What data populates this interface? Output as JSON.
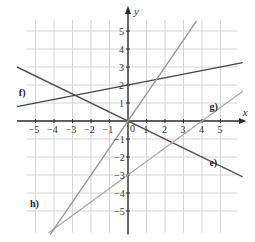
{
  "chart_data": {
    "type": "line",
    "title": "",
    "xlabel": "x",
    "ylabel": "y",
    "xlim": [
      -6,
      6.2
    ],
    "ylim": [
      -6.3,
      6
    ],
    "grid": true,
    "x_ticks": [
      -5,
      -4,
      -3,
      -2,
      -1,
      1,
      2,
      3,
      4,
      5
    ],
    "y_ticks": [
      -5,
      -4,
      -3,
      -2,
      -1,
      1,
      2,
      3,
      4,
      5
    ],
    "origin_label": "0",
    "series": [
      {
        "name": "e)",
        "slope": -0.5,
        "intercept": 0,
        "x_range": [
          -6,
          6.2
        ],
        "color": "#555555",
        "label_pos": [
          4.4,
          -2.5
        ]
      },
      {
        "name": "f)",
        "slope": 0.2,
        "intercept": 2,
        "x_range": [
          -6,
          6.2
        ],
        "color": "#444444",
        "label_pos": [
          -5.9,
          1.4
        ]
      },
      {
        "name": "g)",
        "slope": 0.75,
        "intercept": -3,
        "x_range": [
          -4.3,
          6.2
        ],
        "color": "#aaaaaa",
        "label_pos": [
          4.4,
          0.6
        ]
      },
      {
        "name": "h)",
        "slope": 1.5,
        "intercept": 0,
        "x_range": [
          -4.2,
          3.7
        ],
        "color": "#999999",
        "label_pos": [
          -5.3,
          -4.8
        ]
      }
    ]
  },
  "layout": {
    "origin_px": [
      128,
      121
    ],
    "unit_px_x": 18.5,
    "unit_px_y": 18
  }
}
